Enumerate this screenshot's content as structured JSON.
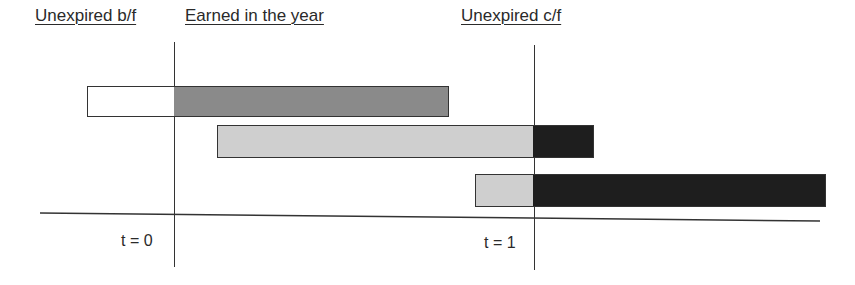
{
  "headings": {
    "unexpired_bf": "Unexpired b/f",
    "earned": "Earned in the year",
    "unexpired_cf": "Unexpired c/f"
  },
  "time_labels": {
    "t0": "t = 0",
    "t1": "t = 1"
  },
  "colors": {
    "unexpired_bf": "#ffffff",
    "earned_dark": "#8a8a8a",
    "earned_light": "#cfcfcf",
    "unexpired_cf": "#1e1e1e",
    "line": "#333333"
  },
  "bars": [
    {
      "segments": [
        {
          "category": "Unexpired b/f",
          "from": -0.24,
          "to": 0.0,
          "fill": "white"
        },
        {
          "category": "Earned in the year",
          "from": 0.0,
          "to": 0.76,
          "fill": "dark grey"
        }
      ]
    },
    {
      "segments": [
        {
          "category": "Earned in the year",
          "from": 0.12,
          "to": 1.0,
          "fill": "light grey"
        },
        {
          "category": "Unexpired c/f",
          "from": 1.0,
          "to": 1.17,
          "fill": "black"
        }
      ]
    },
    {
      "segments": [
        {
          "category": "Earned in the year",
          "from": 0.84,
          "to": 1.0,
          "fill": "light grey"
        },
        {
          "category": "Unexpired c/f",
          "from": 1.0,
          "to": 1.81,
          "fill": "black"
        }
      ]
    }
  ]
}
